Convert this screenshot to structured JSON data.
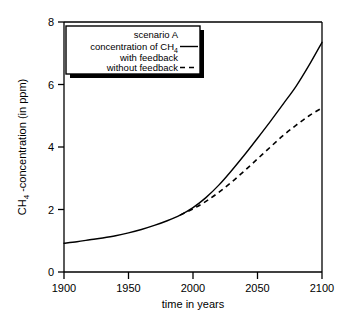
{
  "chart_data": {
    "type": "line",
    "title": "",
    "xlabel": "time in years",
    "ylabel": "CH4 -concentration  (in ppm)",
    "ylabel_main": "CH",
    "ylabel_sub": "4",
    "ylabel_rest": "-concentration  (in ppm)",
    "xlim": [
      1900,
      2100
    ],
    "ylim": [
      0,
      8
    ],
    "xticks": [
      1900,
      1950,
      2000,
      2050,
      2100
    ],
    "xtick_labels": [
      "1900",
      "1950",
      "2000",
      "2050",
      "2100"
    ],
    "yticks": [
      0,
      2,
      4,
      6,
      8
    ],
    "ytick_labels": [
      "0",
      "2",
      "4",
      "6",
      "8"
    ],
    "grid": false,
    "legend_position": "top-left-inside",
    "series": [
      {
        "name": "scenario A concentration of CH4 with feedback",
        "style": "solid",
        "color": "#000000",
        "x": [
          1900,
          1910,
          1920,
          1930,
          1940,
          1950,
          1960,
          1970,
          1980,
          1990,
          2000,
          2010,
          2020,
          2030,
          2040,
          2050,
          2060,
          2070,
          2080,
          2090,
          2100
        ],
        "values": [
          0.92,
          0.97,
          1.03,
          1.09,
          1.16,
          1.25,
          1.36,
          1.49,
          1.64,
          1.82,
          2.06,
          2.38,
          2.78,
          3.25,
          3.75,
          4.28,
          4.82,
          5.38,
          5.95,
          6.62,
          7.35
        ]
      },
      {
        "name": "without feedback",
        "style": "dashed",
        "color": "#000000",
        "x": [
          1990,
          2000,
          2010,
          2020,
          2030,
          2040,
          2050,
          2060,
          2070,
          2080,
          2090,
          2100
        ],
        "values": [
          1.82,
          2.02,
          2.26,
          2.55,
          2.88,
          3.24,
          3.62,
          4.0,
          4.37,
          4.7,
          5.0,
          5.25
        ]
      }
    ]
  },
  "legend": {
    "entry_1": {
      "line_1": "scenario A",
      "line_2_pre": "concentration of CH",
      "line_2_sub": "4",
      "line_3": "with feedback",
      "sample": "solid-line-sample"
    },
    "entry_2": {
      "label": "without feedback",
      "sample": "dashed-line-sample"
    }
  },
  "axes": {
    "x_title": "time in years",
    "y_title_pre": "CH",
    "y_title_sub": "4",
    "y_title_post": " -concentration  (in ppm)"
  }
}
